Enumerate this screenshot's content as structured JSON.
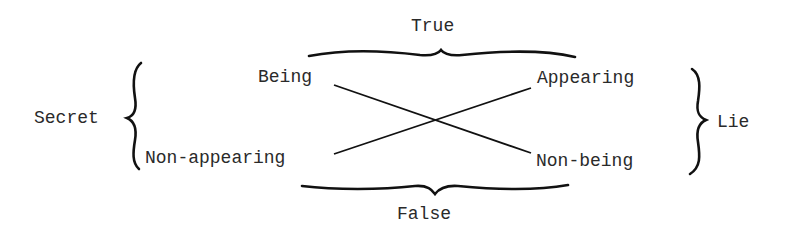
{
  "diagram": {
    "top_label": "True",
    "bottom_label": "False",
    "left_label": "Secret",
    "right_label": "Lie",
    "nodes": {
      "top_left": "Being",
      "top_right": "Appearing",
      "bottom_left": "Non-appearing",
      "bottom_right": "Non-being"
    },
    "edges": [
      {
        "from": "Being",
        "to": "Non-being"
      },
      {
        "from": "Non-appearing",
        "to": "Appearing"
      }
    ],
    "groupings": [
      {
        "brace": "top",
        "label": "True",
        "members": [
          "Being",
          "Appearing"
        ]
      },
      {
        "brace": "bottom",
        "label": "False",
        "members": [
          "Non-appearing",
          "Non-being"
        ]
      },
      {
        "brace": "left",
        "label": "Secret",
        "members": [
          "Being",
          "Non-appearing"
        ]
      },
      {
        "brace": "right",
        "label": "Lie",
        "members": [
          "Appearing",
          "Non-being"
        ]
      }
    ]
  }
}
